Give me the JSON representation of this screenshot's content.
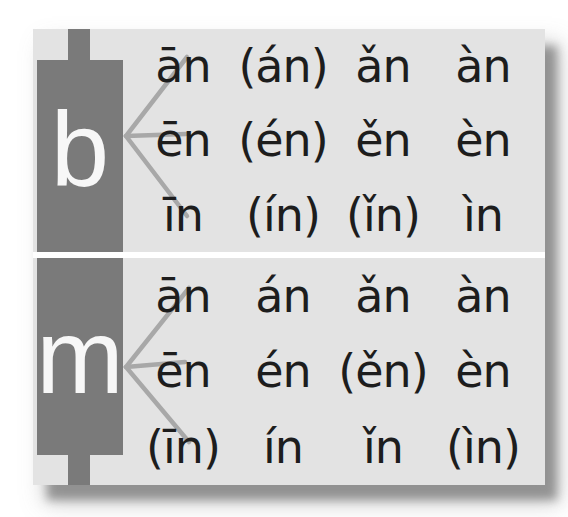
{
  "colors": {
    "page_background": "#ffffff",
    "panel_background": "#e3e3e3",
    "block": "#7a7a7a",
    "initial_letter": "#f7f7f7",
    "connector_line": "#a8a8a8",
    "text": "#1d1d1d",
    "divider": "#ffffff",
    "shadow": "#909090"
  },
  "panel": {
    "sections": [
      {
        "initial": "b",
        "rows": [
          {
            "cells": [
              "ān",
              "(án)",
              "ǎn",
              "àn"
            ]
          },
          {
            "cells": [
              "ēn",
              "(én)",
              "ěn",
              "èn"
            ]
          },
          {
            "cells": [
              "īn",
              "(ín)",
              "(ǐn)",
              "ìn"
            ]
          }
        ]
      },
      {
        "initial": "m",
        "rows": [
          {
            "cells": [
              "ān",
              "án",
              "ǎn",
              "àn"
            ]
          },
          {
            "cells": [
              "ēn",
              "én",
              "(ěn)",
              "èn"
            ]
          },
          {
            "cells": [
              "(īn)",
              "ín",
              "ǐn",
              "(ìn)"
            ]
          }
        ]
      }
    ]
  }
}
